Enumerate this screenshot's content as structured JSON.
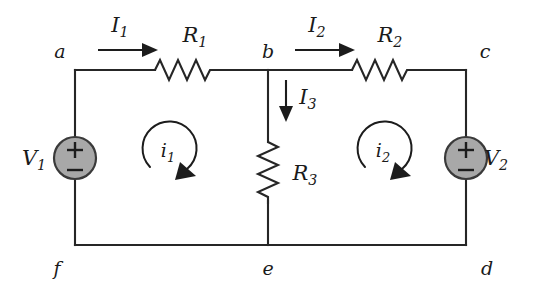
{
  "figure": {
    "background_color": "#ffffff",
    "wire_color": "#262626",
    "source_fill_color": "#a8a8a8",
    "source_stroke_color": "#3a3a3a",
    "label_color": "#1a1a1a"
  },
  "nodes": [
    {
      "id": "a",
      "label": "a",
      "x": 75,
      "y": 70,
      "label_x": 60,
      "label_y": 52
    },
    {
      "id": "b",
      "label": "b",
      "x": 268,
      "y": 70,
      "label_x": 268,
      "label_y": 52
    },
    {
      "id": "c",
      "label": "c",
      "x": 466,
      "y": 70,
      "label_x": 484,
      "label_y": 52
    },
    {
      "id": "d",
      "label": "d",
      "x": 466,
      "y": 245,
      "label_x": 486,
      "label_y": 272
    },
    {
      "id": "e",
      "label": "e",
      "x": 268,
      "y": 245,
      "label_x": 268,
      "label_y": 272
    },
    {
      "id": "f",
      "label": "f",
      "x": 75,
      "y": 245,
      "label_x": 58,
      "label_y": 272
    }
  ],
  "resistors": [
    {
      "id": "R1",
      "base": "R",
      "sub": "1",
      "orientation": "horizontal",
      "label_x": 195,
      "label_y": 42
    },
    {
      "id": "R2",
      "base": "R",
      "sub": "2",
      "orientation": "horizontal",
      "label_x": 390,
      "label_y": 42
    },
    {
      "id": "R3",
      "base": "R",
      "sub": "3",
      "orientation": "vertical",
      "label_x": 305,
      "label_y": 172
    }
  ],
  "sources": [
    {
      "id": "V1",
      "base": "V",
      "sub": "1",
      "plus": "+",
      "minus": "−",
      "polarity_top": "+",
      "polarity_bottom": "−",
      "label_side": "left",
      "label_x": 34,
      "label_y": 158,
      "cx": 75,
      "cy": 158,
      "r": 21
    },
    {
      "id": "V2",
      "base": "V",
      "sub": "2",
      "plus": "+",
      "minus": "−",
      "polarity_top": "+",
      "polarity_bottom": "−",
      "label_side": "right",
      "label_x": 496,
      "label_y": 158,
      "cx": 466,
      "cy": 158,
      "r": 21
    }
  ],
  "branch_currents": [
    {
      "id": "I1",
      "base": "I",
      "sub": "1",
      "direction": "right",
      "label_x": 123,
      "label_y": 32
    },
    {
      "id": "I2",
      "base": "I",
      "sub": "2",
      "direction": "right",
      "label_x": 318,
      "label_y": 32
    },
    {
      "id": "I3",
      "base": "I",
      "sub": "3",
      "direction": "down",
      "label_x": 305,
      "label_y": 104
    }
  ],
  "mesh_currents": [
    {
      "id": "i1",
      "base": "i",
      "sub": "1",
      "direction": "clockwise",
      "label_x": 170,
      "label_y": 155,
      "cx": 170,
      "cy": 150,
      "r": 27
    },
    {
      "id": "i2",
      "base": "i",
      "sub": "2",
      "direction": "clockwise",
      "label_x": 385,
      "label_y": 155,
      "cx": 385,
      "cy": 150,
      "r": 27
    }
  ]
}
